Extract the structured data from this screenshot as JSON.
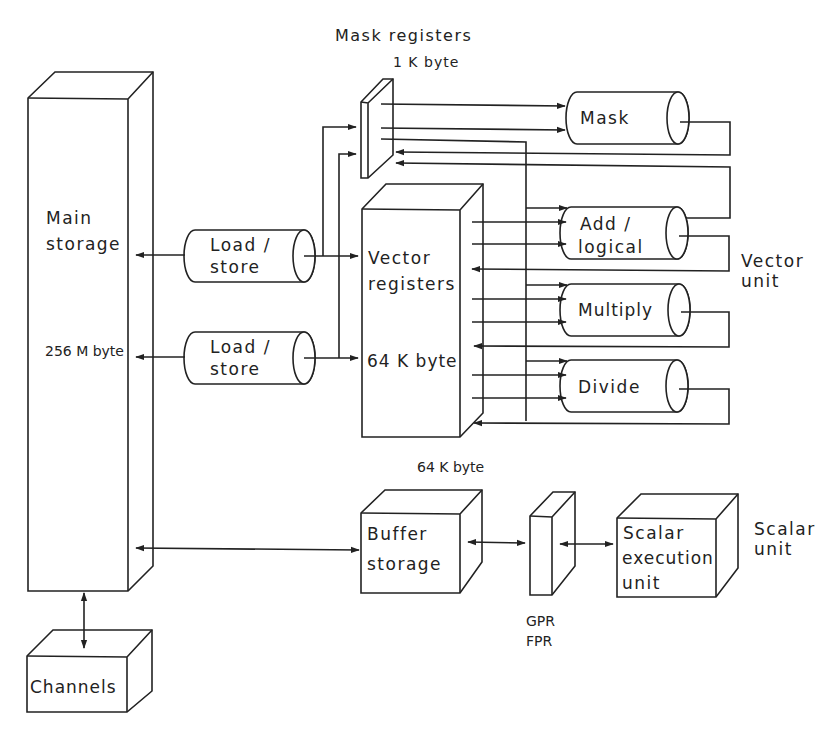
{
  "diagram": {
    "title_labels": {
      "mask_registers": "Mask registers",
      "mask_registers_size": "1 K byte"
    },
    "main_storage": {
      "label_line1": "Main",
      "label_line2": "storage",
      "size": "256 M byte"
    },
    "load_store_1": {
      "line1": "Load /",
      "line2": "store"
    },
    "load_store_2": {
      "line1": "Load /",
      "line2": "store"
    },
    "vector_registers": {
      "line1": "Vector",
      "line2": "registers",
      "size": "64 K byte"
    },
    "pipelines": {
      "mask": "Mask",
      "add_logical": {
        "line1": "Add /",
        "line2": "logical"
      },
      "multiply": "Multiply",
      "divide": "Divide"
    },
    "vector_unit": {
      "line1": "Vector",
      "line2": "unit"
    },
    "buffer_storage": {
      "line1": "Buffer",
      "line2": "storage",
      "size": "64 K byte"
    },
    "gpr_fpr": {
      "line1": "GPR",
      "line2": "FPR"
    },
    "scalar_execution_unit": {
      "line1": "Scalar",
      "line2": "execution",
      "line3": "unit"
    },
    "scalar_unit": {
      "line1": "Scalar",
      "line2": "unit"
    },
    "channels": "Channels",
    "colors": {
      "ink": "#222222",
      "background": "#ffffff"
    }
  }
}
